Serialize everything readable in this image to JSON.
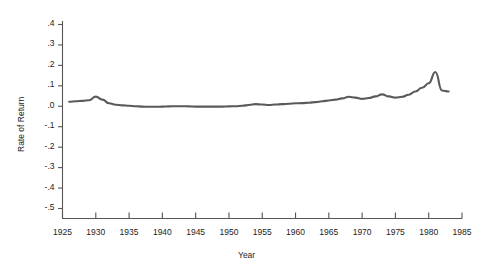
{
  "chart_data": {
    "type": "line",
    "title": "",
    "xlabel": "Year",
    "ylabel": "Rate of Return",
    "xlim": [
      1925,
      1985
    ],
    "ylim": [
      -0.5,
      0.4
    ],
    "grid": false,
    "legend": null,
    "line_color": "#5a5a5a",
    "axis_color": "#4a4a4a",
    "x_ticks": [
      1925,
      1930,
      1935,
      1940,
      1945,
      1950,
      1955,
      1960,
      1965,
      1970,
      1975,
      1980,
      1985
    ],
    "x_tick_labels": [
      "1925",
      "1930",
      "1935",
      "1940",
      "1945",
      "1950",
      "1955",
      "1960",
      "1965",
      "1970",
      "1975",
      "1980",
      "1985"
    ],
    "y_ticks": [
      0.4,
      0.3,
      0.2,
      0.1,
      0.0,
      -0.1,
      -0.2,
      -0.3,
      -0.4,
      -0.5
    ],
    "y_tick_labels": [
      ".4",
      ".3",
      ".2",
      ".1",
      ".0",
      "-.1",
      "-.2",
      "-.3",
      "-.4",
      "-.5"
    ],
    "series": [
      {
        "name": "Rate of Return",
        "x": [
          1926,
          1927,
          1928,
          1929,
          1930,
          1931,
          1932,
          1933,
          1934,
          1935,
          1936,
          1937,
          1938,
          1939,
          1940,
          1941,
          1942,
          1943,
          1944,
          1945,
          1946,
          1947,
          1948,
          1949,
          1950,
          1951,
          1952,
          1953,
          1954,
          1955,
          1956,
          1957,
          1958,
          1959,
          1960,
          1961,
          1962,
          1963,
          1964,
          1965,
          1966,
          1967,
          1968,
          1969,
          1970,
          1971,
          1972,
          1973,
          1974,
          1975,
          1976,
          1977,
          1978,
          1979,
          1980,
          1981,
          1982,
          1983
        ],
        "values": [
          0.02,
          0.022,
          0.024,
          0.027,
          0.045,
          0.03,
          0.012,
          0.005,
          0.002,
          0.0,
          -0.002,
          -0.004,
          -0.005,
          -0.005,
          -0.004,
          -0.003,
          -0.002,
          -0.002,
          -0.003,
          -0.004,
          -0.004,
          -0.004,
          -0.004,
          -0.004,
          -0.003,
          -0.002,
          0.0,
          0.004,
          0.008,
          0.006,
          0.004,
          0.006,
          0.008,
          0.01,
          0.012,
          0.013,
          0.015,
          0.018,
          0.022,
          0.026,
          0.03,
          0.036,
          0.044,
          0.04,
          0.034,
          0.038,
          0.046,
          0.056,
          0.046,
          0.04,
          0.044,
          0.054,
          0.07,
          0.088,
          0.11,
          0.165,
          0.075,
          0.07
        ]
      }
    ]
  },
  "axes": {
    "y_title": "Rate of Return",
    "x_title": "Year"
  }
}
